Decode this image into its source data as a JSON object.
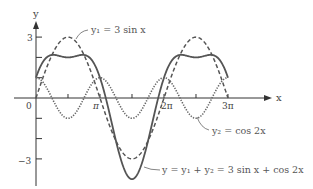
{
  "chart_data": {
    "type": "line",
    "title": "",
    "xlabel": "x",
    "ylabel": "y",
    "xlim": [
      0,
      9.4248
    ],
    "ylim": [
      -4,
      3
    ],
    "grid": false,
    "x_ticks": [
      {
        "value": 0,
        "label": "0"
      },
      {
        "value": 1.5708,
        "label": ""
      },
      {
        "value": 3.1416,
        "label": "π"
      },
      {
        "value": 4.7124,
        "label": ""
      },
      {
        "value": 6.2832,
        "label": "2π"
      },
      {
        "value": 7.854,
        "label": ""
      },
      {
        "value": 9.4248,
        "label": "3π"
      }
    ],
    "y_ticks": [
      {
        "value": 3,
        "label": "3"
      },
      {
        "value": 2,
        "label": ""
      },
      {
        "value": 1,
        "label": ""
      },
      {
        "value": -1,
        "label": ""
      },
      {
        "value": -2,
        "label": ""
      },
      {
        "value": -3,
        "label": "−3"
      }
    ],
    "series": [
      {
        "name": "y₁ = 3 sin x",
        "formula": "3*sin(x)",
        "style": "dashed",
        "color": "#555555",
        "x_range": [
          0,
          9.4248
        ],
        "key_points": [
          [
            0,
            0
          ],
          [
            1.5708,
            3
          ],
          [
            3.1416,
            0
          ],
          [
            4.7124,
            -3
          ],
          [
            6.2832,
            0
          ],
          [
            7.854,
            3
          ],
          [
            9.4248,
            0
          ]
        ]
      },
      {
        "name": "y₂ = cos 2x",
        "formula": "cos(2*x)",
        "style": "dotted",
        "color": "#555555",
        "x_range": [
          0,
          9.4248
        ],
        "key_points": [
          [
            0,
            1
          ],
          [
            0.7854,
            0
          ],
          [
            1.5708,
            -1
          ],
          [
            2.3562,
            0
          ],
          [
            3.1416,
            1
          ],
          [
            4.7124,
            -1
          ],
          [
            6.2832,
            1
          ],
          [
            7.854,
            -1
          ],
          [
            9.4248,
            1
          ]
        ]
      },
      {
        "name": "y = y₁ + y₂ = 3 sin x + cos 2x",
        "formula": "3*sin(x)+cos(2*x)",
        "style": "solid",
        "color": "#555555",
        "x_range": [
          0,
          9.4248
        ],
        "key_points": [
          [
            0,
            1
          ],
          [
            0.848,
            2.125
          ],
          [
            1.5708,
            2
          ],
          [
            2.294,
            2.125
          ],
          [
            3.1416,
            1
          ],
          [
            4.7124,
            -4
          ],
          [
            6.2832,
            1
          ],
          [
            7.131,
            2.125
          ],
          [
            7.854,
            2
          ],
          [
            8.577,
            2.125
          ],
          [
            9.4248,
            1
          ]
        ]
      }
    ],
    "annotations": [
      {
        "text": "y₁ = 3 sin x",
        "target_series": 0
      },
      {
        "text": "y₂ = cos 2x",
        "target_series": 1
      },
      {
        "text": "y = y₁ + y₂ = 3 sin x + cos 2x",
        "target_series": 2
      }
    ],
    "legend": "none (inline annotations)"
  },
  "labels": {
    "y_axis": "y",
    "x_axis": "x",
    "origin": "0",
    "pi": "π",
    "two_pi": "2π",
    "three_pi": "3π",
    "y_three": "3",
    "y_neg_three": "−3",
    "ann_y1": "y₁ = 3 sin x",
    "ann_y2": "y₂ = cos 2x",
    "ann_sum": "y = y₁ + y₂ = 3 sin x + cos 2x"
  }
}
